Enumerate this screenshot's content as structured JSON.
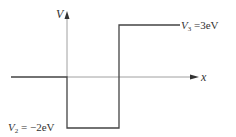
{
  "diagram": {
    "type": "potential-step-well",
    "axes": {
      "y_label": "V",
      "x_label": "x"
    },
    "levels": [
      {
        "region": "x<0",
        "value": "0",
        "label": ""
      },
      {
        "region": "well",
        "value": "-2eV",
        "label_var": "V",
        "label_sub": "2",
        "label_rest": " = −2eV"
      },
      {
        "region": "right",
        "value": "3eV",
        "label_var": "V",
        "label_sub": "3",
        "label_rest": " =3eV"
      }
    ],
    "colors": {
      "line": "#444444",
      "axis": "#888888",
      "text": "#333333"
    }
  }
}
